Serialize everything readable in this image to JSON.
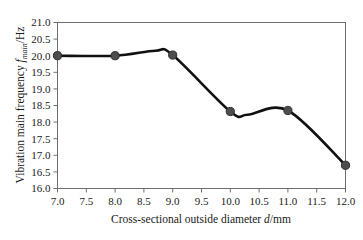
{
  "chart_data": {
    "type": "line",
    "title": "",
    "xlabel": "Cross-sectional outside diameter d/mm",
    "ylabel": "Vibration main frequency f_main/Hz",
    "xlim": [
      7.0,
      12.0
    ],
    "ylim": [
      16.0,
      21.0
    ],
    "grid": false,
    "legend": "none",
    "x": [
      7.0,
      8.0,
      9.0,
      10.0,
      11.0,
      12.0
    ],
    "values": [
      20.0,
      20.0,
      20.02,
      18.32,
      18.35,
      16.7
    ],
    "series": [
      {
        "name": "Vibration main frequency",
        "values": [
          20.0,
          20.0,
          20.02,
          18.32,
          18.35,
          16.7
        ]
      }
    ],
    "curve_shape": "smooth-spline",
    "annotations": [
      {
        "text": "local maximum between 8.0 and 9.0",
        "x": 8.7,
        "y": 20.15
      },
      {
        "text": "local minimum between 10.0 and 11.0",
        "x": 10.3,
        "y": 18.22
      }
    ],
    "xticks": [
      "7.0",
      "7.5",
      "8.0",
      "8.5",
      "9.0",
      "9.5",
      "10.0",
      "10.5",
      "11.0",
      "11.5",
      "12.0"
    ],
    "xtick_values": [
      7.0,
      7.5,
      8.0,
      8.5,
      9.0,
      9.5,
      10.0,
      10.5,
      11.0,
      11.5,
      12.0
    ],
    "yticks": [
      "16.0",
      "16.5",
      "17.0",
      "17.5",
      "18.0",
      "18.5",
      "19.0",
      "19.5",
      "20.0",
      "20.5",
      "21.0"
    ],
    "ytick_values": [
      16.0,
      16.5,
      17.0,
      17.5,
      18.0,
      18.5,
      19.0,
      19.5,
      20.0,
      20.5,
      21.0
    ],
    "colors": {
      "line": "#111111",
      "marker_fill": "#4d4d4d",
      "marker_edge": "#2e2e2e",
      "frame": "#6e6e6e",
      "background": "#ffffff"
    }
  },
  "axis_titles": {
    "x_prefix": "Cross-sectional outside diameter ",
    "x_italic": "d",
    "x_suffix": "/mm",
    "y_prefix": "Vibration main frequency ",
    "y_italic": "f",
    "y_subscript": "main",
    "y_suffix": "/Hz"
  }
}
